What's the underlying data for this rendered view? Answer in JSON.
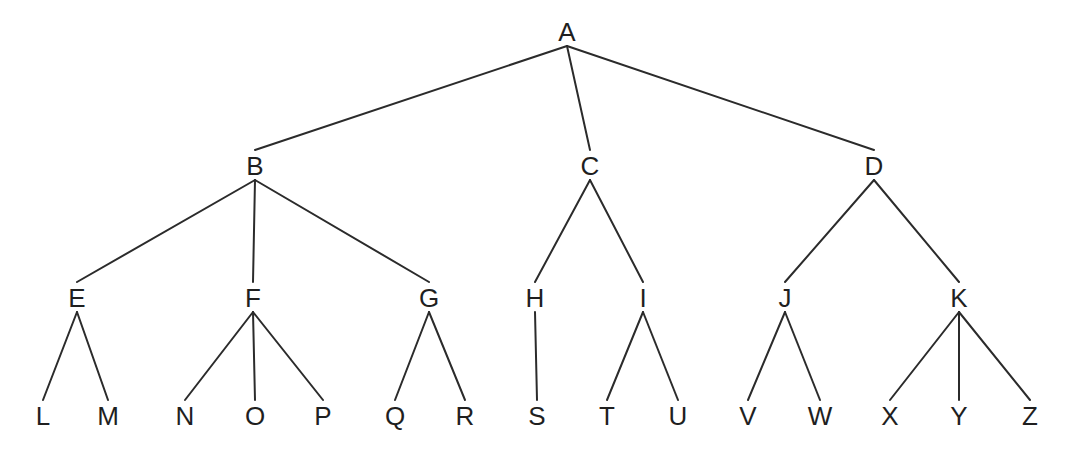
{
  "diagram": {
    "type": "tree",
    "background_color": "#ffffff",
    "line_color": "#2b2b2b",
    "text_color": "#1f1f1f",
    "line_width": 2,
    "font_size": 26,
    "edge_gap_parent": 14,
    "edge_gap_child": 16,
    "root": "A",
    "hierarchy": {
      "A": [
        "B",
        "C",
        "D"
      ],
      "B": [
        "E",
        "F",
        "G"
      ],
      "C": [
        "H",
        "I"
      ],
      "D": [
        "J",
        "K"
      ],
      "E": [
        "L",
        "M"
      ],
      "F": [
        "N",
        "O",
        "P"
      ],
      "G": [
        "Q",
        "R"
      ],
      "H": [
        "S"
      ],
      "I": [
        "T",
        "U"
      ],
      "J": [
        "V",
        "W"
      ],
      "K": [
        "X",
        "Y",
        "Z"
      ]
    },
    "nodes": [
      {
        "id": "A",
        "label": "A",
        "x": 567,
        "y": 32
      },
      {
        "id": "B",
        "label": "B",
        "x": 255,
        "y": 166
      },
      {
        "id": "C",
        "label": "C",
        "x": 590,
        "y": 166
      },
      {
        "id": "D",
        "label": "D",
        "x": 874,
        "y": 166
      },
      {
        "id": "E",
        "label": "E",
        "x": 77,
        "y": 298
      },
      {
        "id": "F",
        "label": "F",
        "x": 253,
        "y": 298
      },
      {
        "id": "G",
        "label": "G",
        "x": 429,
        "y": 298
      },
      {
        "id": "H",
        "label": "H",
        "x": 535,
        "y": 298
      },
      {
        "id": "I",
        "label": "I",
        "x": 643,
        "y": 298
      },
      {
        "id": "J",
        "label": "J",
        "x": 785,
        "y": 298
      },
      {
        "id": "K",
        "label": "K",
        "x": 959,
        "y": 298
      },
      {
        "id": "L",
        "label": "L",
        "x": 43,
        "y": 416
      },
      {
        "id": "M",
        "label": "M",
        "x": 108,
        "y": 416
      },
      {
        "id": "N",
        "label": "N",
        "x": 185,
        "y": 416
      },
      {
        "id": "O",
        "label": "O",
        "x": 255,
        "y": 416
      },
      {
        "id": "P",
        "label": "P",
        "x": 323,
        "y": 416
      },
      {
        "id": "Q",
        "label": "Q",
        "x": 395,
        "y": 416
      },
      {
        "id": "R",
        "label": "R",
        "x": 465,
        "y": 416
      },
      {
        "id": "S",
        "label": "S",
        "x": 537,
        "y": 416
      },
      {
        "id": "T",
        "label": "T",
        "x": 607,
        "y": 416
      },
      {
        "id": "U",
        "label": "U",
        "x": 678,
        "y": 416
      },
      {
        "id": "V",
        "label": "V",
        "x": 748,
        "y": 416
      },
      {
        "id": "W",
        "label": "W",
        "x": 820,
        "y": 416
      },
      {
        "id": "X",
        "label": "X",
        "x": 890,
        "y": 416
      },
      {
        "id": "Y",
        "label": "Y",
        "x": 959,
        "y": 416
      },
      {
        "id": "Z",
        "label": "Z",
        "x": 1030,
        "y": 416
      }
    ],
    "edges": [
      [
        "A",
        "B"
      ],
      [
        "A",
        "C"
      ],
      [
        "A",
        "D"
      ],
      [
        "B",
        "E"
      ],
      [
        "B",
        "F"
      ],
      [
        "B",
        "G"
      ],
      [
        "C",
        "H"
      ],
      [
        "C",
        "I"
      ],
      [
        "D",
        "J"
      ],
      [
        "D",
        "K"
      ],
      [
        "E",
        "L"
      ],
      [
        "E",
        "M"
      ],
      [
        "F",
        "N"
      ],
      [
        "F",
        "O"
      ],
      [
        "F",
        "P"
      ],
      [
        "G",
        "Q"
      ],
      [
        "G",
        "R"
      ],
      [
        "H",
        "S"
      ],
      [
        "I",
        "T"
      ],
      [
        "I",
        "U"
      ],
      [
        "J",
        "V"
      ],
      [
        "J",
        "W"
      ],
      [
        "K",
        "X"
      ],
      [
        "K",
        "Y"
      ],
      [
        "K",
        "Z"
      ]
    ]
  }
}
